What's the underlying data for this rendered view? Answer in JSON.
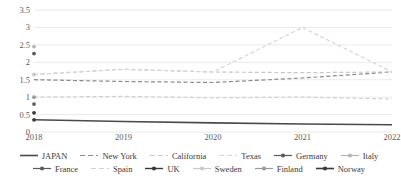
{
  "chart_data": {
    "type": "line",
    "title": "",
    "xlabel": "",
    "ylabel": "",
    "x": [
      2018,
      2019,
      2020,
      2021,
      2022
    ],
    "xtick_labels": [
      "2018",
      "2019",
      "2020",
      "2021",
      "2022"
    ],
    "ytick_labels": [
      "0",
      "0.5",
      "1",
      "1.5",
      "2",
      "2.5",
      "3",
      "3.5"
    ],
    "yticks": [
      0,
      0.5,
      1,
      1.5,
      2,
      2.5,
      3,
      3.5
    ],
    "ylim": [
      0,
      3.5
    ],
    "grid": "horizontal",
    "legend_position": "bottom",
    "series": [
      {
        "name": "JAPAN",
        "values": [
          0.35,
          0.3,
          0.26,
          0.23,
          0.21
        ],
        "color": "#4a4a4a",
        "style": "solid",
        "width": 1.6,
        "marker": "none"
      },
      {
        "name": "New York",
        "values": [
          1.5,
          1.45,
          1.42,
          1.55,
          1.72
        ],
        "color": "#8a8a8a",
        "style": "dashed",
        "width": 1.2,
        "marker": "none"
      },
      {
        "name": "California",
        "values": [
          1.65,
          1.8,
          1.72,
          1.7,
          1.72
        ],
        "color": "#c8c8c8",
        "style": "dashed",
        "width": 1.2,
        "marker": "none"
      },
      {
        "name": "Texas",
        "values": [
          1.65,
          1.8,
          1.72,
          3.0,
          1.72
        ],
        "color": "#d6d6d6",
        "style": "dashed",
        "width": 1.2,
        "marker": "none"
      },
      {
        "name": "Germany",
        "values": [
          2.25,
          null,
          null,
          null,
          null
        ],
        "color": "#5a5a5a",
        "style": "solid",
        "width": 1.2,
        "marker": "dot"
      },
      {
        "name": "Italy",
        "values": [
          2.45,
          null,
          null,
          null,
          null
        ],
        "color": "#b5b5b5",
        "style": "solid",
        "width": 1.2,
        "marker": "dot"
      },
      {
        "name": "France",
        "values": [
          0.8,
          null,
          null,
          null,
          null
        ],
        "color": "#5a5a5a",
        "style": "solid",
        "width": 1.2,
        "marker": "dot"
      },
      {
        "name": "Spain",
        "values": [
          1.0,
          1.02,
          0.98,
          1.0,
          0.95
        ],
        "color": "#d0d0d0",
        "style": "dashed",
        "width": 1.2,
        "marker": "none"
      },
      {
        "name": "UK",
        "values": [
          0.55,
          null,
          null,
          null,
          null
        ],
        "color": "#3a3a3a",
        "style": "solid",
        "width": 1.4,
        "marker": "dot"
      },
      {
        "name": "Sweden",
        "values": [
          1.65,
          null,
          null,
          null,
          null
        ],
        "color": "#c8c8c8",
        "style": "solid",
        "width": 1.2,
        "marker": "dot"
      },
      {
        "name": "Finland",
        "values": [
          1.0,
          null,
          null,
          null,
          null
        ],
        "color": "#9a9a9a",
        "style": "solid",
        "width": 1.2,
        "marker": "dot"
      },
      {
        "name": "Norway",
        "values": [
          0.35,
          null,
          null,
          null,
          null
        ],
        "color": "#3a3a3a",
        "style": "solid",
        "width": 1.6,
        "marker": "dot"
      }
    ]
  },
  "legend": {
    "row1": [
      "JAPAN",
      "New York",
      "California",
      "Texas",
      "Germany",
      "Italy"
    ],
    "row2": [
      "France",
      "Spain",
      "UK",
      "Sweden",
      "Finland",
      "Norway"
    ]
  }
}
